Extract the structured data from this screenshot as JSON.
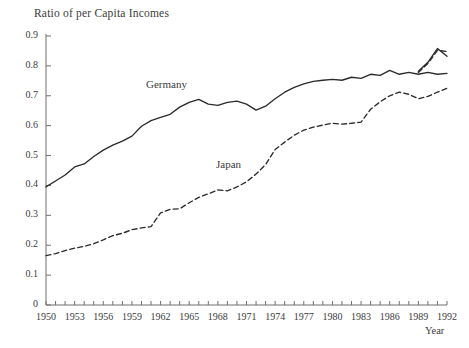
{
  "chart_data": {
    "type": "line",
    "title": "Ratio of per Capita Incomes",
    "xlabel": "Year",
    "ylabel": "",
    "xlim": [
      1950,
      1992
    ],
    "ylim": [
      0,
      0.9
    ],
    "grid": false,
    "legend_position": "inline-annotation",
    "xticks": [
      1950,
      1953,
      1956,
      1959,
      1962,
      1965,
      1968,
      1971,
      1974,
      1977,
      1980,
      1983,
      1986,
      1989,
      1992
    ],
    "xticks_minor_step": 1,
    "yticks": [
      0,
      0.1,
      0.2,
      0.3,
      0.4,
      0.5,
      0.6,
      0.7,
      0.8,
      0.9
    ],
    "ytick_labels": [
      "0",
      "0.1",
      "0.2",
      "0.3",
      "0.4",
      "0.5",
      "0.6",
      "0.7",
      "0.8",
      "0.9"
    ],
    "x": [
      1950,
      1951,
      1952,
      1953,
      1954,
      1955,
      1956,
      1957,
      1958,
      1959,
      1960,
      1961,
      1962,
      1963,
      1964,
      1965,
      1966,
      1967,
      1968,
      1969,
      1970,
      1971,
      1972,
      1973,
      1974,
      1975,
      1976,
      1977,
      1978,
      1979,
      1980,
      1981,
      1982,
      1983,
      1984,
      1985,
      1986,
      1987,
      1988,
      1989,
      1990,
      1991,
      1992
    ],
    "series": [
      {
        "name": "Germany",
        "style": "solid",
        "color": "#2b2b2b",
        "values": [
          0.395,
          0.415,
          0.435,
          0.462,
          0.472,
          0.497,
          0.518,
          0.535,
          0.548,
          0.565,
          0.598,
          0.617,
          0.628,
          0.638,
          0.662,
          0.678,
          0.688,
          0.672,
          0.668,
          0.678,
          0.682,
          0.672,
          0.652,
          0.665,
          0.69,
          0.712,
          0.728,
          0.74,
          0.748,
          0.752,
          0.755,
          0.752,
          0.762,
          0.758,
          0.772,
          0.768,
          0.785,
          0.772,
          0.778,
          0.772,
          0.778,
          0.772,
          0.775
        ]
      },
      {
        "name": "Japan",
        "style": "dashed",
        "color": "#2b2b2b",
        "values": [
          0.165,
          0.172,
          0.182,
          0.19,
          0.196,
          0.205,
          0.218,
          0.232,
          0.24,
          0.252,
          0.258,
          0.262,
          0.308,
          0.32,
          0.322,
          0.342,
          0.36,
          0.372,
          0.385,
          0.382,
          0.395,
          0.412,
          0.438,
          0.47,
          0.52,
          0.545,
          0.568,
          0.585,
          0.595,
          0.602,
          0.608,
          0.605,
          0.608,
          0.612,
          0.655,
          0.68,
          0.7,
          0.712,
          0.705,
          0.69,
          0.698,
          0.712,
          0.725
        ]
      }
    ],
    "convergence_note": {
      "year": 1989,
      "description": "Both series converge near 0.78 around 1989, then rise sharply together to a peak near 0.86 in 1991 before Germany falls to about 0.83 and Japan settles near 0.85 in 1992."
    },
    "tail_segment": {
      "x": [
        1989,
        1990,
        1991,
        1992
      ],
      "germany": [
        0.782,
        0.812,
        0.858,
        0.832
      ],
      "japan": [
        0.778,
        0.808,
        0.852,
        0.848
      ]
    }
  }
}
